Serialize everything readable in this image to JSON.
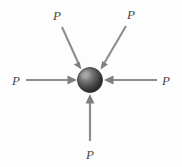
{
  "figure": {
    "canvas": {
      "width": 182,
      "height": 167,
      "background": "#fdfdfd"
    },
    "colors": {
      "arrow": "#8d8d8d",
      "arrow_dark": "#6e6e6e",
      "label": "#4a4a4a",
      "sphere_light": "#9a9a9a",
      "sphere_mid": "#5f5f5f",
      "sphere_dark": "#2b2b2b",
      "sphere_edge": "#1c1c1c"
    },
    "particle": {
      "name": "particle",
      "shape": "sphere",
      "cx": 90,
      "cy": 80,
      "r": 12.5
    },
    "forces": [
      {
        "id": "force-upper-left",
        "label": "P",
        "direction": "down-right",
        "tail": {
          "x": 62,
          "y": 27
        },
        "tip": {
          "x": 81.5,
          "y": 69.5
        },
        "label_pos": {
          "x": 57,
          "y": 20
        }
      },
      {
        "id": "force-upper-right",
        "label": "P",
        "direction": "down-left",
        "tail": {
          "x": 126,
          "y": 26
        },
        "tip": {
          "x": 100.5,
          "y": 69.5
        },
        "label_pos": {
          "x": 131,
          "y": 19
        }
      },
      {
        "id": "force-left",
        "label": "P",
        "direction": "right",
        "tail": {
          "x": 26,
          "y": 80
        },
        "tip": {
          "x": 77,
          "y": 80
        },
        "label_pos": {
          "x": 16,
          "y": 85
        }
      },
      {
        "id": "force-right",
        "label": "P",
        "direction": "left",
        "tail": {
          "x": 157,
          "y": 80
        },
        "tip": {
          "x": 104,
          "y": 80
        },
        "label_pos": {
          "x": 166,
          "y": 85
        }
      },
      {
        "id": "force-bottom",
        "label": "P",
        "direction": "up",
        "tail": {
          "x": 90,
          "y": 141
        },
        "tip": {
          "x": 90,
          "y": 94
        },
        "label_pos": {
          "x": 90,
          "y": 159
        }
      }
    ]
  }
}
